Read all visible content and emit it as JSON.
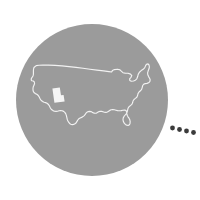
{
  "canvas": {
    "width": 200,
    "height": 200,
    "background_color": "#ffffff"
  },
  "graphic": {
    "type": "map-badge-illustration",
    "title": "United States map with Utah highlighted",
    "alt_text": "Gray circle badge containing a white outline of the contiguous United States with the state of Utah filled white, followed by four trailing dots"
  },
  "circle": {
    "name": "badge-circle",
    "center_x": 92,
    "center_y": 100,
    "radius": 76,
    "fill_color": "#9b9b9b"
  },
  "usa_outline": {
    "name": "usa-map-outline",
    "stroke_color": "#f2f2f2",
    "stroke_width": 1.15,
    "fill": "none"
  },
  "highlight_state": {
    "name": "utah",
    "label": "Utah",
    "fill_color": "#f5f5f5",
    "x": 52,
    "y": 87,
    "width": 12,
    "height": 15
  },
  "trailing_dots": {
    "name": "trailing-dots",
    "count": 4,
    "color": "#3b3b3b",
    "size": 2.4,
    "points": [
      {
        "x": 172.5,
        "y": 128.0
      },
      {
        "x": 179.5,
        "y": 129.5
      },
      {
        "x": 186.5,
        "y": 131.0
      },
      {
        "x": 193.5,
        "y": 132.5
      }
    ]
  }
}
